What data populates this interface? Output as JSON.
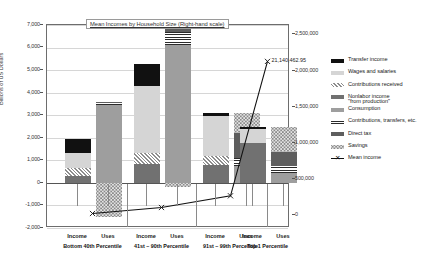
{
  "chart_data": {
    "type": "bar",
    "title": "Mean Incomes by Household Size (Right-hand scale)",
    "ylabel": "Billions of US Dollars",
    "xlabel": "",
    "ylim": [
      -2000,
      7000
    ],
    "ytick_labels": [
      "7,000",
      "6,000",
      "5,000",
      "4,000",
      "3,000",
      "2,000",
      "1,000",
      "0",
      "-1,000",
      "-2,000"
    ],
    "ytick_values": [
      7000,
      6000,
      5000,
      4000,
      3000,
      2000,
      1000,
      0,
      -1000,
      -2000
    ],
    "y2lim": [
      0,
      2500000
    ],
    "y2tick_labels": [
      "2,500,000",
      "2,000,000",
      "1,500,000",
      "1,000,000",
      "500,000",
      "0"
    ],
    "y2tick_values": [
      2500000,
      2000000,
      1500000,
      1000000,
      500000,
      0
    ],
    "grid": true,
    "legend_position": "right",
    "categories": [
      "Income",
      "Uses",
      "Income",
      "Uses",
      "Income",
      "Uses",
      "Income",
      "Uses"
    ],
    "groups": [
      {
        "label": "Bottom 40th Percentile",
        "bars": [
          "Income",
          "Uses"
        ]
      },
      {
        "label": "41st – 90th Percentile",
        "bars": [
          "Income",
          "Uses"
        ]
      },
      {
        "label": "91st – 99th Percentile",
        "bars": [
          "Income",
          "Uses"
        ]
      },
      {
        "label": "Top 1 Percentile",
        "bars": [
          "Income",
          "Uses"
        ]
      }
    ],
    "series": [
      {
        "name": "Transfer income",
        "key": "transfer",
        "color": "#111111",
        "pattern": "solid",
        "values": [
          640,
          null,
          960,
          null,
          130,
          null,
          90,
          null
        ]
      },
      {
        "name": "Wages and salaries",
        "key": "wages",
        "color": "#d5d5d5",
        "pattern": "solid",
        "values": [
          680,
          null,
          3000,
          null,
          1750,
          null,
          660,
          null
        ]
      },
      {
        "name": "Contributions received",
        "key": "contrib_recv",
        "color": "#8d8d8d",
        "pattern": "diagonal-hatch",
        "values": [
          330,
          null,
          480,
          null,
          420,
          null,
          0,
          null
        ]
      },
      {
        "name": "Nonlabor income \"from production\"",
        "key": "nonlabor",
        "color": "#717171",
        "pattern": "solid",
        "values": [
          320,
          null,
          830,
          null,
          790,
          null,
          1750,
          null
        ]
      },
      {
        "name": "Consumption",
        "key": "consumption",
        "color": "#9e9e9e",
        "pattern": "solid",
        "values": [
          null,
          3470,
          null,
          6120,
          null,
          760,
          null,
          430
        ]
      },
      {
        "name": "Contributions, transfers, etc.",
        "key": "contrib_tr",
        "color": "#2b2b2b",
        "pattern": "horizontal-lines",
        "values": [
          null,
          70,
          null,
          560,
          null,
          340,
          null,
          330
        ]
      },
      {
        "name": "Direct tax",
        "key": "directtax",
        "color": "#5e5e5e",
        "pattern": "solid",
        "values": [
          null,
          60,
          null,
          350,
          null,
          1100,
          null,
          620
        ]
      },
      {
        "name": "Savings",
        "key": "savings",
        "color": "#8a8a8a",
        "pattern": "dotted",
        "values": [
          null,
          -1520,
          null,
          -180,
          null,
          900,
          null,
          1120
        ]
      }
    ],
    "mean_income_line": {
      "name": "Mean income",
      "marker": "x",
      "axis": "right",
      "points": [
        {
          "x": "Bottom 40th Percentile",
          "y": 14400
        },
        {
          "x": "41st – 90th Percentile",
          "y": 96000
        },
        {
          "x": "91st – 99th Percentile",
          "y": 258000
        },
        {
          "x": "Top 1 Percentile",
          "y": 2114046
        }
      ],
      "annotation": "21,140,462.95"
    }
  },
  "legend": {
    "items": [
      {
        "label": "Transfer income",
        "swatch": "transfer-swatch"
      },
      {
        "label": "Wages and salaries",
        "swatch": "wages-swatch"
      },
      {
        "label": "Contributions received",
        "swatch": "contributions-received-swatch"
      },
      {
        "label": "Nonlabor income\n\"from production\"",
        "swatch": "nonlabor-income-swatch"
      },
      {
        "label": "Consumption",
        "swatch": "consumption-swatch"
      },
      {
        "label": "Contributions, transfers, etc.",
        "swatch": "contributions-transfers-swatch"
      },
      {
        "label": "Direct tax",
        "swatch": "direct-tax-swatch"
      },
      {
        "label": "Savings",
        "swatch": "savings-swatch"
      },
      {
        "label": "Mean income",
        "swatch": "mean-income-marker-swatch"
      }
    ]
  }
}
